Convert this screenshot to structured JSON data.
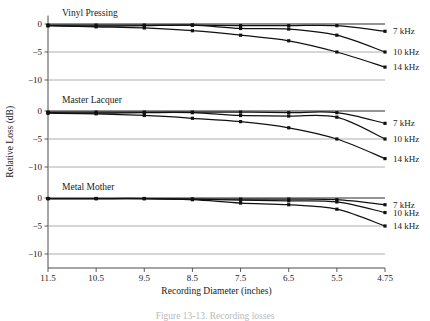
{
  "figure": {
    "caption": "Figure 13-13.  Recording losses",
    "axis": {
      "xlabel": "Recording Diameter (inches)",
      "ylabel": "Relative Loss (dB)",
      "xticks": [
        "11.5",
        "10.5",
        "9.5",
        "8.5",
        "7.5",
        "6.5",
        "5.5",
        "4.75"
      ],
      "yticks": [
        "0",
        "−5",
        "−10"
      ]
    },
    "colors": {
      "curve": "#111111",
      "gridline": "#9a9a9a",
      "axis": "#4a4a4a",
      "background": "#ffffff"
    }
  },
  "chart_data": {
    "type": "line",
    "title": "",
    "xlabel": "Recording Diameter (inches)",
    "ylabel": "Relative Loss (dB)",
    "x": [
      11.5,
      10.5,
      9.5,
      8.5,
      7.5,
      6.5,
      5.5,
      4.75
    ],
    "xtick_labels": [
      "11.5",
      "10.5",
      "9.5",
      "8.5",
      "7.5",
      "6.5",
      "5.5",
      "4.75"
    ],
    "xlim_reversed": true,
    "ylim": [
      -12.5,
      1.5
    ],
    "yticks": [
      0,
      -5,
      -10
    ],
    "grid": true,
    "legend_position": "right-of-axes",
    "legend_entries": [
      "7 kHz",
      "10 kHz",
      "14 kHz"
    ],
    "panels": [
      {
        "name": "Vinyl Pressing",
        "series": [
          {
            "name": "7 kHz",
            "values": [
              -0.2,
              -0.2,
              -0.2,
              -0.2,
              -0.3,
              -0.3,
              -0.3,
              -1.3
            ]
          },
          {
            "name": "10 kHz",
            "values": [
              -0.3,
              -0.4,
              -0.3,
              -0.2,
              -0.8,
              -0.9,
              -2.0,
              -5.0
            ]
          },
          {
            "name": "14 kHz",
            "values": [
              -0.3,
              -0.5,
              -0.7,
              -1.2,
              -2.0,
              -3.0,
              -5.0,
              -7.7
            ]
          }
        ]
      },
      {
        "name": "Master Lacquer",
        "series": [
          {
            "name": "7 kHz",
            "values": [
              -0.2,
              -0.2,
              -0.2,
              -0.2,
              -0.2,
              -0.3,
              -0.3,
              -2.2
            ]
          },
          {
            "name": "10 kHz",
            "values": [
              -0.3,
              -0.4,
              -0.3,
              -0.3,
              -0.8,
              -0.9,
              -1.1,
              -5.0
            ]
          },
          {
            "name": "14 kHz",
            "values": [
              -0.4,
              -0.5,
              -0.8,
              -1.3,
              -1.9,
              -3.0,
              -5.0,
              -8.5
            ]
          }
        ]
      },
      {
        "name": "Metal Mother",
        "series": [
          {
            "name": "7 kHz",
            "values": [
              -0.1,
              -0.1,
              -0.1,
              -0.2,
              -0.2,
              -0.2,
              -0.3,
              -1.2
            ]
          },
          {
            "name": "10 kHz",
            "values": [
              -0.1,
              -0.1,
              -0.1,
              -0.2,
              -0.4,
              -0.5,
              -0.7,
              -2.6
            ]
          },
          {
            "name": "14 kHz",
            "values": [
              -0.1,
              -0.1,
              -0.1,
              -0.3,
              -0.9,
              -1.2,
              -2.0,
              -5.0
            ]
          }
        ]
      }
    ]
  }
}
